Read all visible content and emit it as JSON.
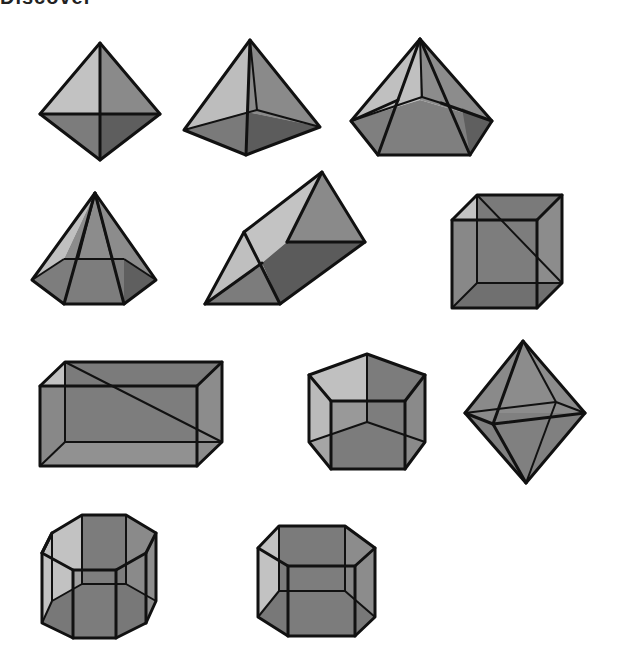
{
  "title": "Discover",
  "shapes": [
    {
      "name": "square-bipyramid"
    },
    {
      "name": "square-pyramid"
    },
    {
      "name": "pentagonal-pyramid"
    },
    {
      "name": "hexagonal-pyramid"
    },
    {
      "name": "triangular-prism"
    },
    {
      "name": "cube"
    },
    {
      "name": "rectangular-prism"
    },
    {
      "name": "pentagonal-prism"
    },
    {
      "name": "octahedron"
    },
    {
      "name": "octagonal-prism"
    },
    {
      "name": "hexagonal-prism"
    }
  ],
  "colors": {
    "light_face": "#c4c4c4",
    "mid_face": "#8e8e8e",
    "dark_face": "#707070",
    "darkest_face": "#5e5e5e",
    "edge": "#111111"
  }
}
